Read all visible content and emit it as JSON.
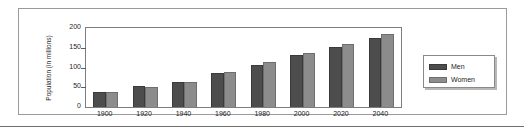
{
  "chart_data": {
    "type": "bar",
    "title": "",
    "xlabel": "",
    "ylabel": "Population (in millions)",
    "categories": [
      "1900",
      "1920",
      "1940",
      "1960",
      "1980",
      "2000",
      "2020",
      "2040"
    ],
    "series": [
      {
        "name": "Men",
        "color": "#4d4d4d",
        "values": [
          38,
          53,
          63,
          86,
          107,
          131,
          153,
          175
        ]
      },
      {
        "name": "Women",
        "color": "#8c8c8c",
        "values": [
          37,
          51,
          64,
          89,
          113,
          136,
          159,
          185
        ]
      }
    ],
    "ylim": [
      0,
      200
    ],
    "yticks": [
      0,
      50,
      100,
      150,
      200
    ],
    "ytick_labels": [
      "0",
      "50",
      "100",
      "150",
      "200"
    ],
    "grid": false,
    "legend_position": "right"
  },
  "legend": {
    "entries": [
      {
        "label": "Men"
      },
      {
        "label": "Women"
      }
    ]
  },
  "colors": {
    "men": "#4d4d4d",
    "women": "#8c8c8c",
    "frame": "#9a9a9a",
    "axis": "#7d7d7d",
    "text": "#1d1d1d"
  }
}
